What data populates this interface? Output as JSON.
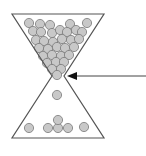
{
  "diagram": {
    "type": "hourglass-with-balls",
    "colors": {
      "outline": "#555555",
      "ball_fill": "#c8c8c8",
      "ball_stroke": "#7a7a7a",
      "arrow": "#111111"
    },
    "hourglass": {
      "top_left": [
        12,
        14
      ],
      "top_right": [
        104,
        14
      ],
      "neck_left": [
        52,
        76
      ],
      "neck_right": [
        64,
        76
      ],
      "bottom_left": [
        12,
        138
      ],
      "bottom_right": [
        104,
        138
      ]
    },
    "arrow": {
      "from": [
        146,
        76
      ],
      "to": [
        67,
        76
      ],
      "points_to": "neck"
    },
    "ball_radius": 4.6,
    "balls_top": [
      [
        29,
        23
      ],
      [
        40,
        24
      ],
      [
        50,
        25
      ],
      [
        70,
        24
      ],
      [
        87,
        23
      ],
      [
        33,
        31
      ],
      [
        41,
        32
      ],
      [
        52,
        33
      ],
      [
        60,
        30
      ],
      [
        67,
        32
      ],
      [
        76,
        30
      ],
      [
        82,
        32
      ],
      [
        36,
        40
      ],
      [
        44,
        41
      ],
      [
        53,
        42
      ],
      [
        62,
        39
      ],
      [
        71,
        40
      ],
      [
        79,
        39
      ],
      [
        39,
        48
      ],
      [
        48,
        49
      ],
      [
        57,
        47
      ],
      [
        65,
        48
      ],
      [
        74,
        47
      ],
      [
        43,
        56
      ],
      [
        52,
        55
      ],
      [
        61,
        56
      ],
      [
        69,
        55
      ],
      [
        47,
        63
      ],
      [
        56,
        62
      ],
      [
        64,
        62
      ],
      [
        52,
        69
      ],
      [
        61,
        69
      ],
      [
        57,
        75
      ]
    ],
    "balls_falling": [
      [
        57,
        95
      ]
    ],
    "balls_bottom": [
      [
        29,
        128
      ],
      [
        48,
        128
      ],
      [
        58,
        128
      ],
      [
        68,
        128
      ],
      [
        84,
        127
      ],
      [
        58,
        120
      ]
    ]
  }
}
